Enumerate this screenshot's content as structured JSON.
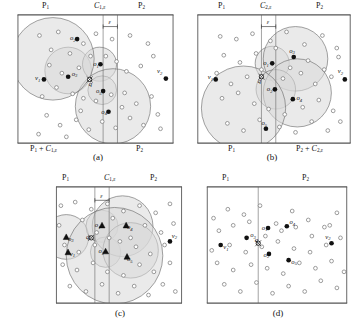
{
  "figure": {
    "caption_a": "(a)",
    "caption_b": "(b)",
    "caption_c": "(c)",
    "caption_d": "(d)"
  },
  "panels": {
    "a": {
      "top_left_label": "P1",
      "top_mid_label": "C1,ε",
      "top_right_label": "P2",
      "bottom_left_label": "P1 + C1,ε",
      "bottom_right_label": "P2",
      "epsilon_label": "ε",
      "points": [
        {
          "name": "v1",
          "label": "v1",
          "x": 30,
          "y": 73,
          "kind": "filled",
          "lx": 20,
          "ly": 74
        },
        {
          "name": "v2",
          "label": "v2",
          "x": 166,
          "y": 72,
          "kind": "filled",
          "lx": 156,
          "ly": 66
        },
        {
          "name": "o2",
          "label": "o2",
          "x": 67,
          "y": 28,
          "kind": "filled",
          "lx": 59,
          "ly": 29
        },
        {
          "name": "o3",
          "label": "o3",
          "x": 57,
          "y": 70,
          "kind": "filled",
          "lx": 61,
          "ly": 69
        },
        {
          "name": "o1",
          "label": "o1",
          "x": 93,
          "y": 56,
          "kind": "filled",
          "lx": 85,
          "ly": 58
        },
        {
          "name": "o5",
          "label": "o5",
          "x": 96,
          "y": 86,
          "kind": "filled",
          "lx": 88,
          "ly": 88
        },
        {
          "name": "o4",
          "label": "o4",
          "x": 102,
          "y": 109,
          "kind": "filled",
          "lx": 94,
          "ly": 111
        },
        {
          "name": "q",
          "label": "q",
          "x": 81,
          "y": 73,
          "kind": "query",
          "lx": 80,
          "ly": 80
        }
      ],
      "circles": [
        {
          "cx": 57,
          "cy": 63,
          "r": 26,
          "shaded": true
        },
        {
          "cx": 92,
          "cy": 56,
          "r": 19,
          "shaded": true
        },
        {
          "cx": 95,
          "cy": 85,
          "r": 16,
          "shaded": true
        },
        {
          "cx": 107,
          "cy": 103,
          "r": 42,
          "shaded": true
        },
        {
          "cx": 40,
          "cy": 50,
          "r": 46,
          "shaded": true
        }
      ],
      "dots": [
        [
          25,
          24
        ],
        [
          46,
          20
        ],
        [
          59,
          44
        ],
        [
          38,
          40
        ],
        [
          74,
          33
        ],
        [
          88,
          22
        ],
        [
          106,
          28
        ],
        [
          126,
          24
        ],
        [
          146,
          33
        ],
        [
          36,
          57
        ],
        [
          50,
          66
        ],
        [
          69,
          60
        ],
        [
          82,
          47
        ],
        [
          99,
          47
        ],
        [
          111,
          53
        ],
        [
          122,
          64
        ],
        [
          138,
          58
        ],
        [
          152,
          47
        ],
        [
          28,
          92
        ],
        [
          44,
          82
        ],
        [
          62,
          89
        ],
        [
          74,
          94
        ],
        [
          88,
          97
        ],
        [
          105,
          90
        ],
        [
          120,
          88
        ],
        [
          133,
          100
        ],
        [
          150,
          92
        ],
        [
          33,
          113
        ],
        [
          48,
          124
        ],
        [
          66,
          118
        ],
        [
          80,
          129
        ],
        [
          95,
          120
        ],
        [
          110,
          127
        ],
        [
          126,
          116
        ],
        [
          141,
          124
        ],
        [
          157,
          112
        ],
        [
          24,
          134
        ],
        [
          55,
          137
        ],
        [
          71,
          108
        ],
        [
          117,
          104
        ],
        [
          160,
          128
        ]
      ]
    },
    "b": {
      "top_left_label": "P1",
      "top_mid_label": "C2,ε",
      "top_right_label": "P2",
      "bottom_left_label": "P1",
      "bottom_right_label": "P2 + C2,ε",
      "epsilon_label": "ε",
      "points": [
        {
          "name": "v1",
          "label": "v1",
          "x": 21,
          "y": 73,
          "kind": "filled",
          "lx": 12,
          "ly": 73
        },
        {
          "name": "v2",
          "label": "v2",
          "x": 165,
          "y": 73,
          "kind": "filled",
          "lx": 157,
          "ly": 66
        },
        {
          "name": "o1",
          "label": "o1",
          "x": 84,
          "y": 55,
          "kind": "filled",
          "lx": 74,
          "ly": 57
        },
        {
          "name": "o3",
          "label": "o3",
          "x": 108,
          "y": 48,
          "kind": "filled",
          "lx": 103,
          "ly": 43
        },
        {
          "name": "o2",
          "label": "o2",
          "x": 87,
          "y": 84,
          "kind": "filled",
          "lx": 78,
          "ly": 86
        },
        {
          "name": "o4",
          "label": "o4",
          "x": 107,
          "y": 95,
          "kind": "filled",
          "lx": 111,
          "ly": 96
        },
        {
          "name": "o5",
          "label": "o5",
          "x": 77,
          "y": 128,
          "kind": "filled",
          "lx": 72,
          "ly": 124
        },
        {
          "name": "q",
          "label": "q",
          "x": 72,
          "y": 70,
          "kind": "query",
          "lx": 68,
          "ly": 77
        }
      ],
      "circles": [
        {
          "cx": 84,
          "cy": 55,
          "r": 19,
          "shaded": true
        },
        {
          "cx": 110,
          "cy": 50,
          "r": 36,
          "shaded": true
        },
        {
          "cx": 88,
          "cy": 84,
          "r": 22,
          "shaded": true
        },
        {
          "cx": 112,
          "cy": 88,
          "r": 38,
          "shaded": true
        },
        {
          "cx": 52,
          "cy": 105,
          "r": 47,
          "shaded": true
        }
      ],
      "dots": [
        [
          26,
          25
        ],
        [
          44,
          28
        ],
        [
          62,
          22
        ],
        [
          82,
          30
        ],
        [
          100,
          20
        ],
        [
          120,
          34
        ],
        [
          140,
          24
        ],
        [
          156,
          38
        ],
        [
          30,
          46
        ],
        [
          48,
          54
        ],
        [
          66,
          44
        ],
        [
          88,
          38
        ],
        [
          104,
          60
        ],
        [
          124,
          52
        ],
        [
          142,
          62
        ],
        [
          158,
          48
        ],
        [
          22,
          66
        ],
        [
          38,
          78
        ],
        [
          56,
          70
        ],
        [
          72,
          62
        ],
        [
          96,
          72
        ],
        [
          116,
          66
        ],
        [
          132,
          78
        ],
        [
          150,
          70
        ],
        [
          28,
          94
        ],
        [
          46,
          88
        ],
        [
          64,
          100
        ],
        [
          80,
          106
        ],
        [
          98,
          112
        ],
        [
          118,
          104
        ],
        [
          136,
          96
        ],
        [
          152,
          108
        ],
        [
          34,
          122
        ],
        [
          52,
          130
        ],
        [
          70,
          118
        ],
        [
          92,
          126
        ],
        [
          110,
          132
        ],
        [
          128,
          120
        ],
        [
          146,
          130
        ],
        [
          160,
          120
        ]
      ]
    },
    "c": {
      "top_left_label": "P1",
      "top_mid_label": "C1,ε",
      "top_right_label": "P2",
      "epsilon_label": "ε",
      "points": [
        {
          "name": "v1",
          "label": "v1",
          "x": 14,
          "y": 74,
          "kind": "tri",
          "lx": 16,
          "ly": 78
        },
        {
          "name": "v2",
          "label": "v2",
          "x": 128,
          "y": 62,
          "kind": "filled",
          "lx": 130,
          "ly": 58
        },
        {
          "name": "o3",
          "label": "o3",
          "x": 12,
          "y": 57,
          "kind": "tri",
          "lx": 14,
          "ly": 61
        },
        {
          "name": "o1",
          "label": "o1",
          "x": 52,
          "y": 44,
          "kind": "tri",
          "lx": 44,
          "ly": 46
        },
        {
          "name": "o4",
          "label": "o4",
          "x": 79,
          "y": 44,
          "kind": "tri",
          "lx": 80,
          "ly": 48
        },
        {
          "name": "o2",
          "label": "o2",
          "x": 56,
          "y": 73,
          "kind": "tri",
          "lx": 48,
          "ly": 75
        },
        {
          "name": "o5",
          "label": "o5",
          "x": 80,
          "y": 79,
          "kind": "tri",
          "lx": 80,
          "ly": 84
        },
        {
          "name": "q",
          "label": "q",
          "x": 40,
          "y": 58,
          "kind": "query",
          "lx": 34,
          "ly": 59
        }
      ],
      "circles": [
        {
          "cx": 12,
          "cy": 57,
          "r": 25,
          "shaded": true
        },
        {
          "cx": 52,
          "cy": 45,
          "r": 18,
          "shaded": true
        },
        {
          "cx": 56,
          "cy": 74,
          "r": 17,
          "shaded": true
        },
        {
          "cx": 75,
          "cy": 45,
          "r": 34,
          "shaded": true
        },
        {
          "cx": 84,
          "cy": 72,
          "r": 31,
          "shaded": true
        },
        {
          "cx": 66,
          "cy": 78,
          "r": 54,
          "shaded": true
        }
      ],
      "dots": [
        [
          6,
          22
        ],
        [
          22,
          18
        ],
        [
          40,
          26
        ],
        [
          58,
          20
        ],
        [
          76,
          28
        ],
        [
          94,
          22
        ],
        [
          112,
          30
        ],
        [
          128,
          20
        ],
        [
          4,
          44
        ],
        [
          30,
          38
        ],
        [
          46,
          52
        ],
        [
          64,
          36
        ],
        [
          84,
          58
        ],
        [
          100,
          44
        ],
        [
          118,
          52
        ],
        [
          132,
          42
        ],
        [
          10,
          66
        ],
        [
          26,
          74
        ],
        [
          44,
          66
        ],
        [
          60,
          58
        ],
        [
          72,
          62
        ],
        [
          90,
          68
        ],
        [
          106,
          76
        ],
        [
          122,
          66
        ],
        [
          8,
          88
        ],
        [
          24,
          94
        ],
        [
          42,
          86
        ],
        [
          58,
          96
        ],
        [
          76,
          100
        ],
        [
          94,
          88
        ],
        [
          110,
          96
        ],
        [
          128,
          86
        ],
        [
          16,
          112
        ],
        [
          34,
          118
        ],
        [
          52,
          110
        ],
        [
          70,
          120
        ],
        [
          88,
          112
        ],
        [
          104,
          122
        ],
        [
          120,
          110
        ],
        [
          134,
          118
        ]
      ]
    },
    "d": {
      "top_left_label": "P1",
      "top_right_label": "P2",
      "points": [
        {
          "name": "v1",
          "label": "v1",
          "x": 16,
          "y": 66,
          "kind": "filled",
          "lx": 19,
          "ly": 71
        },
        {
          "name": "v2",
          "label": "v2",
          "x": 140,
          "y": 64,
          "kind": "filled",
          "lx": 133,
          "ly": 59
        },
        {
          "name": "o3",
          "label": "o3",
          "x": 45,
          "y": 58,
          "kind": "filled",
          "lx": 49,
          "ly": 57
        },
        {
          "name": "o1",
          "label": "o1",
          "x": 69,
          "y": 47,
          "kind": "filled",
          "lx": 62,
          "ly": 49
        },
        {
          "name": "o4",
          "label": "o4",
          "x": 90,
          "y": 45,
          "kind": "filled",
          "lx": 93,
          "ly": 43
        },
        {
          "name": "o2",
          "label": "o2",
          "x": 70,
          "y": 76,
          "kind": "filled",
          "lx": 64,
          "ly": 79
        },
        {
          "name": "o5",
          "label": "o5",
          "x": 92,
          "y": 83,
          "kind": "filled",
          "lx": 95,
          "ly": 87
        },
        {
          "name": "q",
          "label": "q",
          "x": 58,
          "y": 64,
          "kind": "query",
          "lx": 54,
          "ly": 63
        }
      ],
      "circles": [],
      "dots": [
        [
          8,
          36
        ],
        [
          24,
          26
        ],
        [
          42,
          32
        ],
        [
          60,
          22
        ],
        [
          78,
          42
        ],
        [
          96,
          28
        ],
        [
          114,
          38
        ],
        [
          132,
          46
        ],
        [
          146,
          30
        ],
        [
          14,
          50
        ],
        [
          30,
          44
        ],
        [
          48,
          40
        ],
        [
          66,
          56
        ],
        [
          84,
          50
        ],
        [
          100,
          46
        ],
        [
          118,
          56
        ],
        [
          138,
          44
        ],
        [
          6,
          72
        ],
        [
          26,
          66
        ],
        [
          44,
          74
        ],
        [
          62,
          68
        ],
        [
          80,
          62
        ],
        [
          98,
          70
        ],
        [
          116,
          74
        ],
        [
          134,
          66
        ],
        [
          150,
          58
        ],
        [
          12,
          86
        ],
        [
          30,
          94
        ],
        [
          50,
          88
        ],
        [
          68,
          92
        ],
        [
          86,
          98
        ],
        [
          104,
          86
        ],
        [
          122,
          92
        ],
        [
          140,
          84
        ],
        [
          154,
          96
        ],
        [
          20,
          110
        ],
        [
          38,
          118
        ],
        [
          56,
          108
        ],
        [
          74,
          120
        ],
        [
          92,
          112
        ],
        [
          110,
          118
        ],
        [
          128,
          106
        ],
        [
          146,
          114
        ]
      ]
    }
  },
  "colors": {
    "stroke": "#6b6b6b",
    "shade": "#d9d9d9",
    "frame": "#555555",
    "dot_stroke": "#777777",
    "point_fill": "#111111",
    "text": "#111111"
  }
}
